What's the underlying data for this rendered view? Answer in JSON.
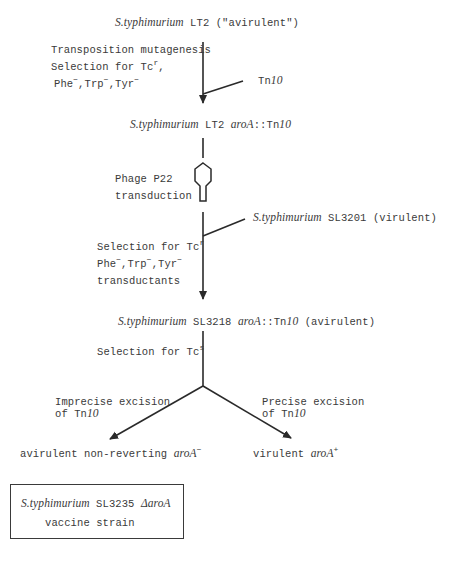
{
  "start": {
    "organism": "S.typhimurium",
    "strain": "LT2",
    "note": "(\"avirulent\")"
  },
  "step1": {
    "lines": [
      "Transposition mutagenesis",
      "Selection for Tc",
      ",",
      "Phe",
      ",Trp",
      ",Tyr"
    ],
    "line1": "Transposition mutagenesis",
    "line2": "Selection for Tc",
    "line2_sup": "r",
    "line2_tail": ",",
    "line3_a": "Phe",
    "line3_b": ",Trp",
    "line3_c": ",Tyr",
    "minus": "−",
    "branch_label_pre": "Tn",
    "branch_label_num": "10"
  },
  "intermediate1": {
    "organism": "S.typhimurium",
    "strain": "LT2",
    "gene": "aroA",
    "sep": "::",
    "tn_pre": "Tn",
    "tn_num": "10"
  },
  "step2": {
    "line1": "Phage P22",
    "line2": "transduction"
  },
  "donor": {
    "organism": "S.typhimurium",
    "strain": "SL3201",
    "note": "(virulent)"
  },
  "step3": {
    "line1": "Selection for Tc",
    "line1_sup": "r",
    "line2_a": "Phe",
    "line2_b": ",Trp",
    "line2_c": ",Tyr",
    "minus": "−",
    "line3": "transductants"
  },
  "intermediate2": {
    "organism": "S.typhimurium",
    "strain": "SL3218",
    "gene": "aroA",
    "sep": "::",
    "tn_pre": "Tn",
    "tn_num": "10",
    "note": "(avirulent)"
  },
  "step4": {
    "label": "Selection for Tc",
    "sup": "s"
  },
  "left_branch": {
    "line1": "Imprecise excision",
    "line2_pre": "of Tn",
    "line2_num": "10",
    "result_pre": "avirulent non-reverting",
    "result_gene": "aroA",
    "result_sup": "−"
  },
  "right_branch": {
    "line1": "Precise excision",
    "line2_pre": "of Tn",
    "line2_num": "10",
    "result_pre": "virulent",
    "result_gene": "aroA",
    "result_sup": "+"
  },
  "final_box": {
    "organism": "S.typhimurium",
    "strain": "SL3235",
    "gene": "ΔaroA",
    "line2": "vaccine strain"
  }
}
